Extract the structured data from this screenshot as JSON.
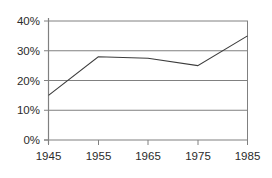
{
  "chart_data": {
    "type": "line",
    "title": "",
    "subtitle": "",
    "xlabel": "",
    "ylabel": "",
    "x": [
      "1945",
      "1955",
      "1965",
      "1975",
      "1985"
    ],
    "categories": [
      "1945",
      "1955",
      "1965",
      "1975",
      "1985"
    ],
    "values": [
      15,
      28,
      27.5,
      25,
      35
    ],
    "series": [
      {
        "name": "",
        "values": [
          15,
          28,
          27.5,
          25,
          35
        ]
      }
    ],
    "xticklabels": [
      "1945",
      "1955",
      "1965",
      "1975",
      "1985"
    ],
    "yticklabels": [
      "0%",
      "10%",
      "20%",
      "30%",
      "40%"
    ],
    "yticks": [
      0,
      10,
      20,
      30,
      40
    ],
    "ylim": [
      0,
      40
    ],
    "xlim": [
      1945,
      1985
    ],
    "grid": "horizontal",
    "legend": "none",
    "annotations": [],
    "colors": {
      "line": "#3c3c3c",
      "grid": "#808080",
      "frame": "#808080",
      "text": "#2b2b2b",
      "background": "#ffffff"
    }
  }
}
